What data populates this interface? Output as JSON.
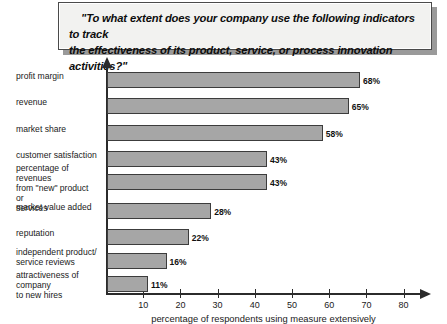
{
  "title": {
    "line1": "\"To what extent does your company use the following indicators to track",
    "line2": "the effectiveness of its product, service, or process innovation activities?\""
  },
  "chart_data": {
    "type": "bar",
    "orientation": "horizontal",
    "title": "\"To what extent does your company use the following indicators to track the effectiveness of its product, service, or process innovation activities?\"",
    "xlabel": "percentage of respondents using measure extensively",
    "ylabel": "",
    "xlim": [
      0,
      83
    ],
    "grid": false,
    "legend": false,
    "categories": [
      "profit margin",
      "revenue",
      "market share",
      "customer satisfaction",
      "percentage of revenues from \"new\" product or services",
      "market value added",
      "reputation",
      "independent product/ service reviews",
      "attractiveness of company to new hires"
    ],
    "values": [
      68,
      65,
      58,
      43,
      43,
      28,
      22,
      16,
      11
    ],
    "data_labels": [
      "68%",
      "65%",
      "58%",
      "43%",
      "43%",
      "28%",
      "22%",
      "16%",
      "11%"
    ],
    "xticks": [
      10,
      20,
      30,
      40,
      50,
      60,
      70,
      80
    ],
    "xtick_labels": [
      "10",
      "20",
      "30",
      "40",
      "50",
      "60",
      "70",
      "80"
    ],
    "bar_color": "#a6a6a6",
    "bar_edge_color": "#3c3c3c",
    "axis_color": "#2b2b2b",
    "background": "#ffffff"
  },
  "category_labels": [
    {
      "lines": [
        "profit margin"
      ]
    },
    {
      "lines": [
        "revenue"
      ]
    },
    {
      "lines": [
        "market share"
      ]
    },
    {
      "lines": [
        "customer satisfaction"
      ]
    },
    {
      "lines": [
        "percentage of revenues",
        "from \"new\" product or",
        "services"
      ]
    },
    {
      "lines": [
        "market value added"
      ]
    },
    {
      "lines": [
        "reputation"
      ]
    },
    {
      "lines": [
        "independent product/",
        "service reviews"
      ]
    },
    {
      "lines": [
        "attractiveness of company",
        "to new hires"
      ]
    }
  ],
  "axis": {
    "caption": "percentage of respondents using measure extensively"
  }
}
